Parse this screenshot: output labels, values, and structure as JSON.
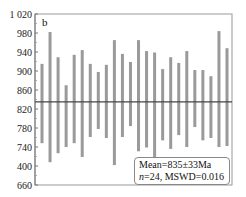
{
  "chart_data": {
    "type": "errorbar",
    "title": "",
    "panel_label": "b",
    "xlabel": "",
    "ylabel": "",
    "ylim": [
      660,
      1020
    ],
    "yticks": [
      660,
      700,
      740,
      780,
      820,
      860,
      900,
      940,
      980,
      1020
    ],
    "ytick_labels": [
      "660",
      "400",
      "740",
      "780",
      "820",
      "860",
      "900",
      "940",
      "980",
      "1 020"
    ],
    "grid": false,
    "mean_line": 835,
    "bars": [
      {
        "low": 748,
        "high": 915
      },
      {
        "low": 708,
        "high": 982
      },
      {
        "low": 727,
        "high": 929
      },
      {
        "low": 740,
        "high": 870
      },
      {
        "low": 748,
        "high": 934
      },
      {
        "low": 719,
        "high": 944
      },
      {
        "low": 761,
        "high": 915
      },
      {
        "low": 778,
        "high": 898
      },
      {
        "low": 759,
        "high": 913
      },
      {
        "low": 702,
        "high": 965
      },
      {
        "low": 761,
        "high": 936
      },
      {
        "low": 784,
        "high": 919
      },
      {
        "low": 731,
        "high": 965
      },
      {
        "low": 739,
        "high": 942
      },
      {
        "low": 712,
        "high": 939
      },
      {
        "low": 754,
        "high": 904
      },
      {
        "low": 736,
        "high": 929
      },
      {
        "low": 765,
        "high": 917
      },
      {
        "low": 740,
        "high": 942
      },
      {
        "low": 782,
        "high": 902
      },
      {
        "low": 754,
        "high": 902
      },
      {
        "low": 759,
        "high": 889
      },
      {
        "low": 740,
        "high": 984
      },
      {
        "low": 742,
        "high": 948
      }
    ],
    "annotation": {
      "line1": "Mean=835±33Ma",
      "line2_n_label": "n",
      "line2_rest": "=24, MSWD=0.016"
    },
    "colors": {
      "bar": "#9a9a9a",
      "mean_line": "#444444",
      "frame": "#999999"
    }
  }
}
